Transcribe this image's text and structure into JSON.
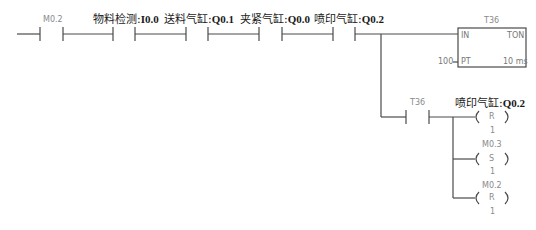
{
  "diagram": {
    "type": "PLC ladder diagram",
    "rung_main": {
      "contacts": [
        {
          "address": "M0.2",
          "name": "",
          "type": "NO"
        },
        {
          "name": "物料检测",
          "address": "I0.0",
          "type": "NO"
        },
        {
          "name": "送料气缸",
          "address": "Q0.1",
          "type": "NO"
        },
        {
          "name": "夹紧气缸",
          "address": "Q0.0",
          "type": "NO"
        },
        {
          "name": "喷印气缸",
          "address": "Q0.2",
          "type": "NO"
        }
      ],
      "timer": {
        "address": "T36",
        "type": "TON",
        "input_in": "IN",
        "input_pt": "PT",
        "pt_value": "100",
        "resolution": "10 ms"
      }
    },
    "branch": {
      "contact": {
        "address": "T36",
        "type": "NO"
      },
      "coils": [
        {
          "name": "喷印气缸",
          "address": "Q0.2",
          "op": "R",
          "count": "1"
        },
        {
          "name": "",
          "address": "M0.3",
          "op": "S",
          "count": "1"
        },
        {
          "name": "",
          "address": "M0.2",
          "op": "R",
          "count": "1"
        }
      ]
    }
  },
  "labels": {
    "c1_addr": "M0.2",
    "c2_name": "物料检测",
    "c2_addr": "I0.0",
    "c3_name": "送料气缸",
    "c3_addr": "Q0.1",
    "c4_name": "夹紧气缸",
    "c4_addr": "Q0.0",
    "c5_name": "喷印气缸",
    "c5_addr": "Q0.2",
    "sep": ":",
    "timer_addr": "T36",
    "timer_in": "IN",
    "timer_type": "TON",
    "timer_pt_label": "PT",
    "timer_pt_value": "100",
    "timer_res": "10 ms",
    "branch_contact": "T36",
    "coil1_name": "喷印气缸",
    "coil1_addr": "Q0.2",
    "coil1_op": "R",
    "coil1_n": "1",
    "coil2_addr": "M0.3",
    "coil2_op": "S",
    "coil2_n": "1",
    "coil3_addr": "M0.2",
    "coil3_op": "R",
    "coil3_n": "1"
  }
}
